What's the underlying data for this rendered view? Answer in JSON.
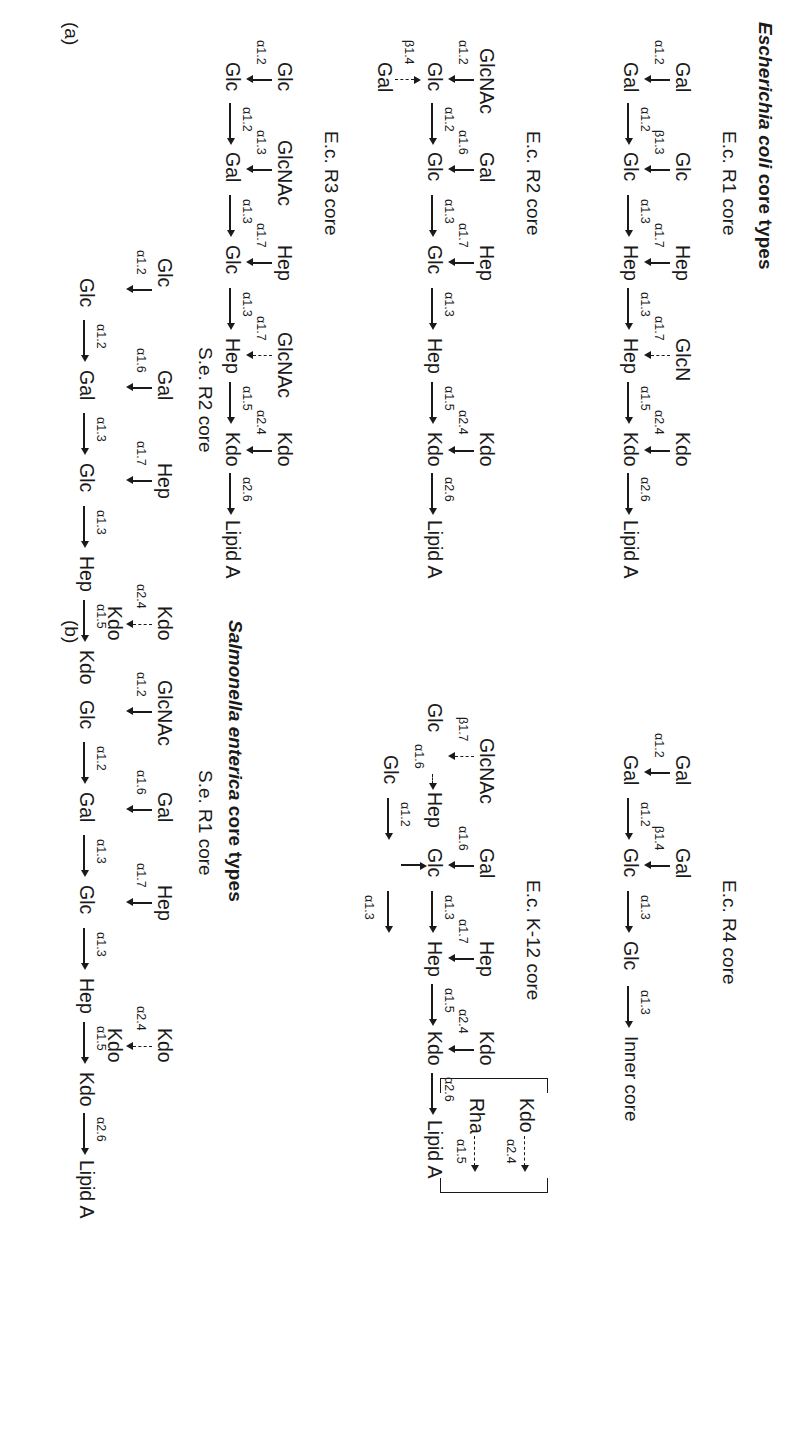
{
  "figure": {
    "panels": [
      {
        "letter": "(a)",
        "title_italic": "Escherichia coli",
        "title_rest": " core types"
      },
      {
        "letter": "(b)",
        "title_italic": "Salmonella enterica",
        "title_rest": " core types"
      }
    ],
    "inner_core_label": "Inner core",
    "core_titles": {
      "ec_r1": "E.c. R1 core",
      "ec_r2": "E.c. R2 core",
      "ec_r3": "E.c. R3 core",
      "ec_r4": "E.c. R4 core",
      "ec_k12": "E.c. K-12 core",
      "se_r1": "S.e. R1 core",
      "se_r2": "S.e. R2 core"
    },
    "residues": {
      "gal": "Gal",
      "glc": "Glc",
      "hep": "Hep",
      "kdo": "Kdo",
      "rha": "Rha",
      "glcn": "GlcN",
      "glcnac": "GlcNAc",
      "lipid_a": "Lipid A"
    },
    "bonds": {
      "a12": "α1.2",
      "a13": "α1.3",
      "a14": "α1.4",
      "a15": "α1.5",
      "a16": "α1.6",
      "a17": "α1.7",
      "b13": "β1.3",
      "b14": "β1.4",
      "b17": "β1.7",
      "a24": "α2.4",
      "a26": "α2.6"
    }
  },
  "structures": {
    "ec_r1": {
      "name": "E.c. R1 core",
      "backbone": [
        "Gal",
        "Gal",
        "Glc",
        "Glc",
        "Hep",
        "Hep",
        "Kdo",
        "Lipid A"
      ],
      "backbone_bonds": [
        "α1.2",
        "α1.3",
        "α1.3",
        "α1.3",
        "α1.5",
        "α2.6"
      ],
      "branches": [
        {
          "from": "Gal",
          "to": "Gal",
          "bond": "α1.2",
          "dashed": false
        },
        {
          "from": "Glc",
          "to": "Glc",
          "bond": "β1.3",
          "dashed": false
        },
        {
          "from": "Hep",
          "to": "Hep",
          "bond": "α1.7",
          "dashed": false
        },
        {
          "from": "Hep",
          "to": "GlcN",
          "bond": "α1.7",
          "dashed": true
        },
        {
          "from": "Kdo",
          "to": "Kdo",
          "bond": "α2.4",
          "dashed": false
        }
      ]
    },
    "ec_r2": {
      "name": "E.c. R2 core",
      "backbone": [
        "Glc",
        "Glc",
        "Glc",
        "Hep",
        "Hep",
        "Kdo",
        "Lipid A"
      ],
      "backbone_bonds": [
        "α1.2",
        "α1.3",
        "α1.3",
        "α1.5",
        "α2.6"
      ],
      "branches": [
        {
          "from": "Glc",
          "to": "GlcNAc",
          "bond": "α1.2",
          "dashed": false
        },
        {
          "from": "Glc",
          "to": "Gal",
          "bond": "β1.4",
          "dashed": true
        },
        {
          "from": "Glc",
          "to": "Gal",
          "bond": "α1.6",
          "dashed": false
        },
        {
          "from": "Hep",
          "to": "Hep",
          "bond": "α1.7",
          "dashed": false
        },
        {
          "from": "Kdo",
          "to": "Kdo",
          "bond": "α2.4",
          "dashed": false
        }
      ]
    },
    "ec_r3": {
      "name": "E.c. R3 core",
      "backbone": [
        "Glc",
        "Gal",
        "Glc",
        "Hep",
        "Hep",
        "Kdo",
        "Lipid A"
      ],
      "backbone_bonds": [
        "α1.2",
        "α1.3",
        "α1.3",
        "α1.5",
        "α2.6"
      ],
      "branches": [
        {
          "from": "Glc",
          "to": "Glc",
          "bond": "α1.2",
          "dashed": false
        },
        {
          "from": "Gal",
          "to": "GlcNAc",
          "bond": "α1.3",
          "dashed": false
        },
        {
          "from": "Hep",
          "to": "Hep",
          "bond": "α1.7",
          "dashed": false
        },
        {
          "from": "Hep",
          "to": "GlcNAc",
          "bond": "α1.7",
          "dashed": true
        },
        {
          "from": "Kdo",
          "to": "Kdo",
          "bond": "α2.4",
          "dashed": false
        }
      ]
    },
    "ec_r4": {
      "name": "E.c. R4 core",
      "backbone": [
        "Gal",
        "Gal",
        "Glc",
        "Glc",
        "Inner core"
      ],
      "backbone_bonds": [
        "α1.2",
        "α1.3",
        "α1.3"
      ],
      "branches": [
        {
          "from": "Gal",
          "to": "Gal",
          "bond": "α1.2",
          "dashed": false
        },
        {
          "from": "Glc",
          "to": "Gal",
          "bond": "β1.4",
          "dashed": false
        }
      ]
    },
    "ec_k12": {
      "name": "E.c. K-12 core",
      "backbone": [
        "Glc",
        "Glc",
        "Glc",
        "Hep",
        "Hep",
        "Kdo",
        "Lipid A"
      ],
      "backbone_bonds": [
        "α1.2",
        "α1.3",
        "α1.3",
        "α1.5",
        "α2.6"
      ],
      "branches": [
        {
          "from": "Glc",
          "to": "Hep",
          "bond": "α1.6",
          "dashed": true
        },
        {
          "from": "Hep",
          "to": "GlcNAc",
          "bond": "β1.7",
          "dashed": true
        },
        {
          "from": "Glc",
          "to": "Gal",
          "bond": "α1.6",
          "dashed": false
        },
        {
          "from": "Hep",
          "to": "Hep",
          "bond": "α1.7",
          "dashed": false
        },
        {
          "from": "Kdo",
          "to": "Kdo",
          "bond": "α2.4",
          "dashed": false
        },
        {
          "from": "Kdo",
          "to": "Kdo",
          "bond": "α2.4",
          "dashed": true,
          "bracketed": true
        },
        {
          "from": "Kdo",
          "to": "Rha",
          "bond": "α1.5",
          "dashed": true,
          "bracketed": true
        }
      ]
    },
    "se_r1": {
      "name": "S.e. R1 core",
      "backbone": [
        "Glc",
        "Gal",
        "Glc",
        "Hep",
        "Hep",
        "Kdo",
        "Lipid A"
      ],
      "backbone_bonds": [
        "α1.2",
        "α1.3",
        "α1.3",
        "α1.5",
        "α2.6"
      ],
      "branches": [
        {
          "from": "Glc",
          "to": "GlcNAc",
          "bond": "α1.2",
          "dashed": false
        },
        {
          "from": "Glc",
          "to": "Gal",
          "bond": "α1.6",
          "dashed": false
        },
        {
          "from": "Hep",
          "to": "Hep",
          "bond": "α1.7",
          "dashed": false
        },
        {
          "from": "Kdo",
          "to": "Kdo",
          "bond": "α2.4",
          "dashed": false
        },
        {
          "from": "Kdo",
          "to": "Kdo",
          "bond": "α2.4",
          "dashed": true
        }
      ]
    },
    "se_r2": {
      "name": "S.e. R2 core",
      "backbone": [
        "Glc",
        "Gal",
        "Glc",
        "Hep",
        "Hep",
        "Kdo",
        "Lipid A"
      ],
      "backbone_bonds": [
        "α1.2",
        "α1.3",
        "α1.3",
        "α1.5",
        "α2.6"
      ],
      "branches": [
        {
          "from": "Glc",
          "to": "Glc",
          "bond": "α1.2",
          "dashed": false
        },
        {
          "from": "Glc",
          "to": "Gal",
          "bond": "α1.6",
          "dashed": false
        },
        {
          "from": "Hep",
          "to": "Hep",
          "bond": "α1.7",
          "dashed": false
        },
        {
          "from": "Kdo",
          "to": "Kdo",
          "bond": "α2.4",
          "dashed": false
        },
        {
          "from": "Kdo",
          "to": "Kdo",
          "bond": "α2.4",
          "dashed": true
        }
      ]
    }
  }
}
